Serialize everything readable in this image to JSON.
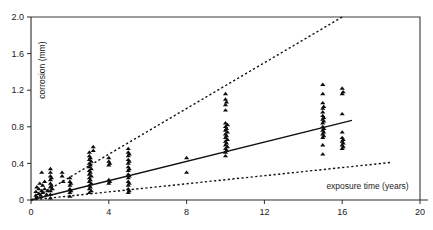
{
  "chart_data": {
    "type": "scatter",
    "title": "",
    "xlabel": "exposure time (years)",
    "ylabel": "corrosion (mm)",
    "xlim": [
      0,
      20
    ],
    "ylim": [
      0,
      2.0
    ],
    "xticks": [
      0,
      4,
      8,
      12,
      16,
      20
    ],
    "xtick_labels": [
      "0",
      "4",
      "8",
      "12",
      "16",
      "20"
    ],
    "yticks": [
      0,
      0.4,
      0.8,
      1.2,
      1.6,
      2.0
    ],
    "ytick_labels": [
      "0",
      "0.4",
      "0.8",
      "1.2",
      "1.6",
      "2.0"
    ],
    "grid": false,
    "legend": null,
    "marker_style": "filled-triangle",
    "series": [
      {
        "name": "corrosion measurements",
        "type": "scatter",
        "points": [
          [
            0.25,
            0.05
          ],
          [
            0.25,
            0.09
          ],
          [
            0.3,
            0.14
          ],
          [
            0.3,
            0.03
          ],
          [
            0.4,
            0.07
          ],
          [
            0.4,
            0.12
          ],
          [
            0.45,
            0.18
          ],
          [
            0.5,
            0.05
          ],
          [
            0.55,
            0.3
          ],
          [
            0.55,
            0.1
          ],
          [
            0.6,
            0.16
          ],
          [
            0.6,
            0.08
          ],
          [
            0.7,
            0.2
          ],
          [
            0.7,
            0.12
          ],
          [
            0.8,
            0.06
          ],
          [
            0.85,
            0.1
          ],
          [
            1.0,
            0.34
          ],
          [
            1.0,
            0.3
          ],
          [
            1.0,
            0.26
          ],
          [
            1.0,
            0.22
          ],
          [
            1.0,
            0.18
          ],
          [
            1.0,
            0.14
          ],
          [
            1.0,
            0.1
          ],
          [
            1.0,
            0.06
          ],
          [
            1.0,
            0.02
          ],
          [
            1.05,
            0.16
          ],
          [
            1.05,
            0.24
          ],
          [
            1.1,
            0.12
          ],
          [
            1.6,
            0.3
          ],
          [
            1.6,
            0.26
          ],
          [
            1.65,
            0.2
          ],
          [
            2.0,
            0.24
          ],
          [
            2.0,
            0.2
          ],
          [
            2.0,
            0.16
          ],
          [
            2.0,
            0.12
          ],
          [
            2.0,
            0.08
          ],
          [
            2.0,
            0.04
          ],
          [
            2.05,
            0.18
          ],
          [
            2.05,
            0.1
          ],
          [
            3.0,
            0.52
          ],
          [
            3.0,
            0.48
          ],
          [
            3.0,
            0.44
          ],
          [
            3.0,
            0.4
          ],
          [
            3.0,
            0.36
          ],
          [
            3.0,
            0.32
          ],
          [
            3.0,
            0.28
          ],
          [
            3.0,
            0.24
          ],
          [
            3.0,
            0.2
          ],
          [
            3.0,
            0.16
          ],
          [
            3.0,
            0.12
          ],
          [
            3.0,
            0.08
          ],
          [
            3.05,
            0.46
          ],
          [
            3.05,
            0.38
          ],
          [
            3.05,
            0.3
          ],
          [
            3.05,
            0.22
          ],
          [
            3.05,
            0.14
          ],
          [
            3.1,
            0.42
          ],
          [
            3.1,
            0.34
          ],
          [
            3.1,
            0.26
          ],
          [
            3.1,
            0.18
          ],
          [
            3.1,
            0.1
          ],
          [
            3.2,
            0.58
          ],
          [
            3.2,
            0.54
          ],
          [
            4.0,
            0.46
          ],
          [
            4.0,
            0.42
          ],
          [
            4.0,
            0.38
          ],
          [
            4.0,
            0.22
          ],
          [
            4.0,
            0.18
          ],
          [
            4.05,
            0.4
          ],
          [
            4.05,
            0.2
          ],
          [
            5.0,
            0.56
          ],
          [
            5.0,
            0.52
          ],
          [
            5.0,
            0.48
          ],
          [
            5.0,
            0.44
          ],
          [
            5.0,
            0.4
          ],
          [
            5.0,
            0.36
          ],
          [
            5.0,
            0.32
          ],
          [
            5.0,
            0.28
          ],
          [
            5.0,
            0.24
          ],
          [
            5.0,
            0.2
          ],
          [
            5.0,
            0.16
          ],
          [
            5.0,
            0.12
          ],
          [
            5.0,
            0.08
          ],
          [
            5.05,
            0.5
          ],
          [
            5.05,
            0.42
          ],
          [
            5.05,
            0.34
          ],
          [
            5.05,
            0.26
          ],
          [
            5.05,
            0.18
          ],
          [
            5.05,
            0.1
          ],
          [
            8.0,
            0.46
          ],
          [
            8.0,
            0.3
          ],
          [
            10.0,
            1.16
          ],
          [
            10.0,
            1.1
          ],
          [
            10.0,
            1.04
          ],
          [
            10.0,
            0.98
          ],
          [
            10.0,
            0.84
          ],
          [
            10.0,
            0.8
          ],
          [
            10.0,
            0.76
          ],
          [
            10.0,
            0.72
          ],
          [
            10.0,
            0.68
          ],
          [
            10.0,
            0.64
          ],
          [
            10.0,
            0.6
          ],
          [
            10.0,
            0.56
          ],
          [
            10.0,
            0.52
          ],
          [
            10.0,
            0.48
          ],
          [
            10.05,
            1.07
          ],
          [
            10.05,
            0.78
          ],
          [
            10.05,
            0.7
          ],
          [
            10.05,
            0.62
          ],
          [
            10.05,
            0.54
          ],
          [
            10.1,
            0.82
          ],
          [
            10.1,
            0.74
          ],
          [
            10.1,
            0.66
          ],
          [
            10.1,
            0.58
          ],
          [
            15.0,
            1.26
          ],
          [
            15.0,
            1.16
          ],
          [
            15.0,
            1.06
          ],
          [
            15.0,
            1.0
          ],
          [
            15.0,
            0.96
          ],
          [
            15.0,
            0.92
          ],
          [
            15.0,
            0.88
          ],
          [
            15.0,
            0.84
          ],
          [
            15.0,
            0.8
          ],
          [
            15.0,
            0.76
          ],
          [
            15.0,
            0.72
          ],
          [
            15.0,
            0.68
          ],
          [
            15.0,
            0.6
          ],
          [
            15.0,
            0.5
          ],
          [
            15.05,
            1.02
          ],
          [
            15.05,
            0.9
          ],
          [
            15.05,
            0.86
          ],
          [
            15.05,
            0.78
          ],
          [
            15.05,
            0.74
          ],
          [
            15.05,
            0.7
          ],
          [
            16.0,
            1.22
          ],
          [
            16.0,
            1.16
          ],
          [
            16.0,
            0.94
          ],
          [
            16.0,
            0.74
          ],
          [
            16.0,
            0.68
          ],
          [
            16.0,
            0.64
          ],
          [
            16.0,
            0.6
          ],
          [
            16.0,
            0.56
          ],
          [
            16.05,
            1.18
          ],
          [
            16.05,
            0.66
          ],
          [
            16.05,
            0.58
          ],
          [
            16.05,
            0.62
          ]
        ]
      },
      {
        "name": "mean regression line",
        "type": "line",
        "style": "solid",
        "x": [
          0,
          16.5
        ],
        "y": [
          0,
          0.87
        ]
      },
      {
        "name": "upper bound",
        "type": "line",
        "style": "dashed",
        "x": [
          0,
          16.0
        ],
        "y": [
          0,
          2.0
        ]
      },
      {
        "name": "lower bound",
        "type": "line",
        "style": "dashed",
        "x": [
          0,
          18.5
        ],
        "y": [
          0,
          0.41
        ]
      }
    ]
  }
}
